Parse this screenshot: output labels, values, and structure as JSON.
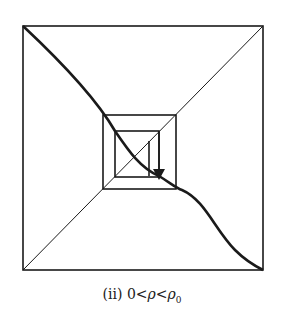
{
  "figure": {
    "caption_label": "(ii)",
    "caption_condition_lhs": "0",
    "caption_lt1": "<",
    "caption_var": "ρ",
    "caption_lt2": "<",
    "caption_rhs": "ρ",
    "caption_rhs_sub": "0",
    "stroke_color": "#1a1a1a",
    "outer_square": {
      "x1": 23,
      "y1": 26,
      "x2": 263,
      "y2": 270
    },
    "middle_square": {
      "x1": 103,
      "y1": 115,
      "x2": 176,
      "y2": 189
    },
    "inner_square": {
      "x1": 115,
      "y1": 131,
      "x2": 159,
      "y2": 177
    },
    "arrow": {
      "direction": "down"
    }
  }
}
